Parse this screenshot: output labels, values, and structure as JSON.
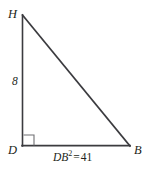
{
  "figure": {
    "type": "right-triangle-geometry-diagram",
    "background_color": "#ffffff",
    "stroke_color": "#3b3b3f",
    "text_color": "#231f20",
    "vertices": {
      "h": {
        "label": "H",
        "x": 22,
        "y": 15
      },
      "d": {
        "label": "D",
        "x": 22,
        "y": 146
      },
      "b": {
        "label": "B",
        "x": 130,
        "y": 146
      }
    },
    "right_angle": {
      "at_vertex": "D",
      "marker": "right-angle-square",
      "size": 11
    },
    "side_labels": {
      "dh": "8",
      "db_expression": {
        "variable": "DB",
        "exponent": "2",
        "equals": "=",
        "value": "41",
        "full_text": "DB2 = 41"
      }
    },
    "segments": [
      {
        "name": "DH",
        "from": "d",
        "to": "h"
      },
      {
        "name": "HB",
        "from": "h",
        "to": "b"
      },
      {
        "name": "DB",
        "from": "d",
        "to": "b"
      }
    ]
  }
}
